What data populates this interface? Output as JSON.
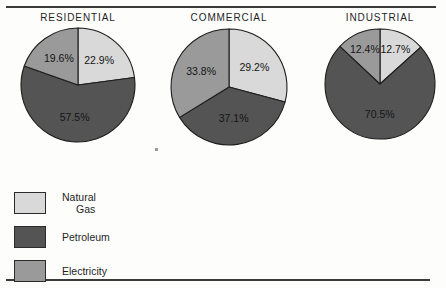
{
  "figure": {
    "background_color": "#fdfdfc",
    "rule_color": "#3a3a3a"
  },
  "legend": {
    "title": "",
    "items": [
      {
        "label_line1": "Natural",
        "label_line2": "Gas",
        "color": "#d9d9d9",
        "key": "natural-gas"
      },
      {
        "label_line1": "Petroleum",
        "label_line2": "",
        "color": "#545454",
        "key": "petroleum"
      },
      {
        "label_line1": "Electricity",
        "label_line2": "",
        "color": "#9a9a9a",
        "key": "electricity"
      }
    ]
  },
  "chart_data": [
    {
      "type": "pie",
      "title": "RESIDENTIAL",
      "categories": [
        "Natural Gas",
        "Petroleum",
        "Electricity"
      ],
      "values": [
        22.9,
        57.5,
        19.6
      ],
      "labels": [
        "22.9%",
        "57.5%",
        "19.6%"
      ],
      "colors": [
        "#d9d9d9",
        "#545454",
        "#9a9a9a"
      ],
      "start_angle": 0,
      "direction": "clockwise",
      "legend_position": "bottom-left"
    },
    {
      "type": "pie",
      "title": "COMMERCIAL",
      "categories": [
        "Natural Gas",
        "Petroleum",
        "Electricity"
      ],
      "values": [
        29.2,
        37.1,
        33.8
      ],
      "labels": [
        "29.2%",
        "37.1%",
        "33.8%"
      ],
      "colors": [
        "#d9d9d9",
        "#545454",
        "#9a9a9a"
      ],
      "start_angle": 0,
      "direction": "clockwise",
      "legend_position": "bottom-left"
    },
    {
      "type": "pie",
      "title": "INDUSTRIAL",
      "categories": [
        "Natural Gas",
        "Petroleum",
        "Electricity"
      ],
      "values": [
        12.7,
        70.5,
        12.4
      ],
      "labels": [
        "12.7%",
        "70.5%",
        "12.4%"
      ],
      "colors": [
        "#d9d9d9",
        "#545454",
        "#9a9a9a"
      ],
      "start_angle": 0,
      "direction": "clockwise",
      "legend_position": "bottom-left"
    }
  ]
}
